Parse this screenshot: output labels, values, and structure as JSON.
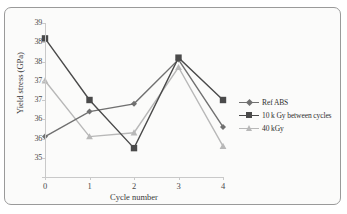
{
  "chart_data": {
    "type": "line",
    "title": "",
    "xlabel": "Cycle number",
    "ylabel": "Yield stress (GPa)",
    "x": [
      0,
      1,
      2,
      3,
      4
    ],
    "xtick_labels": [
      "0",
      "1",
      "2",
      "3",
      "4"
    ],
    "xlim": [
      0,
      4
    ],
    "ylim": [
      35,
      39
    ],
    "ytick_values": [
      39,
      38.5,
      38,
      37.5,
      37,
      36.5,
      36,
      35.5,
      35
    ],
    "ytick_labels": [
      "39",
      "38",
      "38",
      "37",
      "37",
      "36",
      "36",
      "35"
    ],
    "grid": false,
    "legend_position": "right",
    "series": [
      {
        "name": "Ref ABS",
        "values": [
          36.05,
          36.7,
          36.9,
          38.05,
          36.3
        ],
        "color": "#707070",
        "marker": "diamond"
      },
      {
        "name": "10 k Gy between cycles",
        "values": [
          38.6,
          37.0,
          35.75,
          38.1,
          37.0
        ],
        "color": "#4a4a4a",
        "marker": "square"
      },
      {
        "name": "40 kGy",
        "values": [
          37.5,
          36.05,
          36.15,
          37.85,
          35.8
        ],
        "color": "#b8b8b8",
        "marker": "triangle"
      }
    ]
  },
  "legend": {
    "items": [
      {
        "label": "Ref ABS"
      },
      {
        "label": "10 k Gy between cycles"
      },
      {
        "label": "40 kGy"
      }
    ]
  },
  "axes": {
    "x_title": "Cycle number",
    "y_title": "Yield stress (GPa)"
  }
}
